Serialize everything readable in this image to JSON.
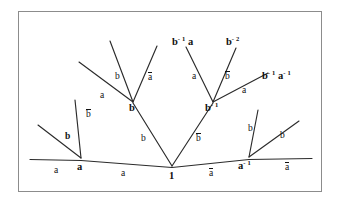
{
  "figure": {
    "kind": "cayley-graph-tree",
    "frame_color": "#8c8c8c",
    "edge_color": "#2b2b2b",
    "text_color": "#111111",
    "background": "#ffffff"
  },
  "chart_data": {
    "type": "diagram",
    "title": "",
    "vertices": [
      {
        "id": "identity",
        "label": "1",
        "label_html": "1",
        "x": 172,
        "y": 170
      },
      {
        "id": "a",
        "label": "a",
        "label_html": "a",
        "x": 81,
        "y": 160
      },
      {
        "id": "a-inv",
        "label": "a-1",
        "label_html": "a<sup>- 1</sup>",
        "x": 249,
        "y": 159
      },
      {
        "id": "b",
        "label": "b",
        "label_html": "b",
        "x": 133,
        "y": 106
      },
      {
        "id": "b-inv",
        "label": "b-1",
        "label_html": "b<sup>- 1</sup>",
        "x": 213,
        "y": 106
      },
      {
        "id": "b-inv-a",
        "label": "b-1 a",
        "label_html": "b<sup>- 1</sup> a",
        "x": 182,
        "y": 41
      },
      {
        "id": "b-inv-2",
        "label": "b-2",
        "label_html": "b<sup>- 2</sup>",
        "x": 234,
        "y": 41
      },
      {
        "id": "b-inv-a-inv",
        "label": "b-1 a-1",
        "label_html": "b<sup>- 1</sup> a<sup>- 1</sup>",
        "x": 270,
        "y": 76
      }
    ],
    "edge_labels": [
      {
        "id": "edge-a-left-outer",
        "text": "a",
        "overbar": false,
        "x": 57,
        "y": 165
      },
      {
        "id": "edge-a-left-inner",
        "text": "a",
        "overbar": false,
        "x": 124,
        "y": 168
      },
      {
        "id": "edge-a-right-inner",
        "text": "a",
        "overbar": true,
        "x": 212,
        "y": 168
      },
      {
        "id": "edge-a-right-outer",
        "text": "a",
        "overbar": true,
        "x": 288,
        "y": 163
      },
      {
        "id": "edge-b-left-stem",
        "text": "b",
        "overbar": false,
        "x": 143,
        "y": 136
      },
      {
        "id": "edge-b-right-stem",
        "text": "b",
        "overbar": true,
        "x": 198,
        "y": 136
      },
      {
        "id": "edge-b-from-a-up",
        "text": "b",
        "overbar": true,
        "x": 89,
        "y": 113
      },
      {
        "id": "edge-b-from-a-diag",
        "text": "b",
        "overbar": false,
        "x": 69,
        "y": 135
      },
      {
        "id": "edge-a-upper-left",
        "text": "a",
        "overbar": false,
        "x": 103,
        "y": 94
      },
      {
        "id": "edge-b-upper-left",
        "text": "b",
        "overbar": false,
        "x": 117,
        "y": 75
      },
      {
        "id": "edge-a-upper-mid",
        "text": "a",
        "overbar": true,
        "x": 151,
        "y": 77
      },
      {
        "id": "edge-a-binv-left",
        "text": "a",
        "overbar": false,
        "x": 195,
        "y": 75
      },
      {
        "id": "edge-b-binv-right",
        "text": "b",
        "overbar": true,
        "x": 228,
        "y": 75
      },
      {
        "id": "edge-a-binv-diag",
        "text": "a",
        "overbar": false,
        "x": 245,
        "y": 88
      },
      {
        "id": "edge-b-right-steep",
        "text": "b",
        "overbar": false,
        "x": 250,
        "y": 127
      },
      {
        "id": "edge-b-right-diag",
        "text": "b",
        "overbar": false,
        "x": 283,
        "y": 134
      }
    ],
    "edges": [
      {
        "from": "a",
        "to": "identity",
        "label": "a"
      },
      {
        "from": "a-inv",
        "to": "identity",
        "label": "a-bar"
      },
      {
        "from": "b",
        "to": "identity",
        "label": "b"
      },
      {
        "from": "b-inv",
        "to": "identity",
        "label": "b-bar"
      },
      {
        "from": "b-inv-a",
        "to": "b-inv",
        "label": "a"
      },
      {
        "from": "b-inv-2",
        "to": "b-inv",
        "label": "b-bar"
      },
      {
        "from": "b-inv-a-inv",
        "to": "b-inv",
        "label": "a"
      }
    ]
  }
}
